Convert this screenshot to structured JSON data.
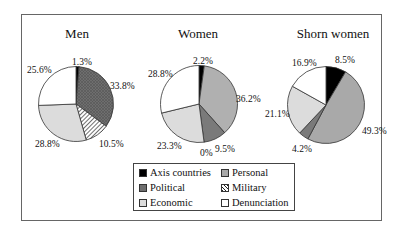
{
  "chart_data": {
    "type": "pie",
    "title": "",
    "legend": [
      "Axis countries",
      "Personal",
      "Political",
      "Military",
      "Economic",
      "Denunciation"
    ],
    "colors": {
      "Axis countries": "#000000",
      "Personal": "#a9a9a9",
      "Political": "#777777",
      "Military": "hatched",
      "Economic": "#dcdcdc",
      "Denunciation": "#ffffff"
    },
    "charts": [
      {
        "title": "Men",
        "slices": [
          {
            "label": "Axis countries",
            "value": 1.3,
            "text": "1.3%"
          },
          {
            "label": "Political",
            "value": 33.8,
            "text": "33.8%"
          },
          {
            "label": "Military",
            "value": 10.5,
            "text": "10.5%"
          },
          {
            "label": "Economic",
            "value": 28.8,
            "text": "28.8%"
          },
          {
            "label": "Denunciation",
            "value": 25.6,
            "text": "25.6%"
          }
        ]
      },
      {
        "title": "Women",
        "slices": [
          {
            "label": "Axis countries",
            "value": 2.2,
            "text": "2.2%"
          },
          {
            "label": "Personal",
            "value": 36.2,
            "text": "36.2%"
          },
          {
            "label": "Political",
            "value": 9.5,
            "text": "9.5%"
          },
          {
            "label": "Military",
            "value": 0,
            "text": "0%"
          },
          {
            "label": "Economic",
            "value": 23.3,
            "text": "23.3%"
          },
          {
            "label": "Denunciation",
            "value": 28.8,
            "text": "28.8%"
          }
        ]
      },
      {
        "title": "Shorn women",
        "slices": [
          {
            "label": "Axis countries",
            "value": 8.5,
            "text": "8.5%"
          },
          {
            "label": "Personal",
            "value": 49.3,
            "text": "49.3%"
          },
          {
            "label": "Political",
            "value": 4.2,
            "text": "4.2%"
          },
          {
            "label": "Economic",
            "value": 21.1,
            "text": "21.1%"
          },
          {
            "label": "Denunciation",
            "value": 16.9,
            "text": "16.9%"
          }
        ]
      }
    ]
  },
  "titles": {
    "men": "Men",
    "women": "Women",
    "shorn": "Shorn women"
  },
  "labels": {
    "men": {
      "axis": "1.3%",
      "political": "33.8%",
      "military": "10.5%",
      "economic": "28.8%",
      "denunciation": "25.6%"
    },
    "women": {
      "axis": "2.2%",
      "personal": "36.2%",
      "political": "9.5%",
      "military": "0%",
      "economic": "23.3%",
      "denunciation": "28.8%"
    },
    "shorn": {
      "axis": "8.5%",
      "personal": "49.3%",
      "political": "4.2%",
      "economic": "21.1%",
      "denunciation": "16.9%"
    }
  },
  "legend": {
    "axis": "Axis countries",
    "personal": "Personal",
    "political": "Political",
    "military": "Military",
    "economic": "Economic",
    "denunciation": "Denunciation"
  }
}
